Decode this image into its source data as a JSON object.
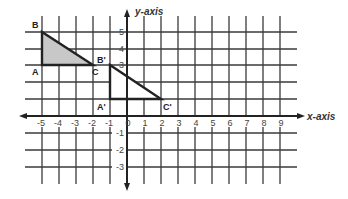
{
  "diagram": {
    "type": "coordinate-plane",
    "x_axis": {
      "label": "x-axis",
      "min": -5,
      "max": 9,
      "tick_labels": [
        "-5",
        "-4",
        "-3",
        "-2",
        "-1",
        "0",
        "1",
        "2",
        "3",
        "4",
        "5",
        "6",
        "7",
        "8",
        "9"
      ]
    },
    "y_axis": {
      "label": "y-axis",
      "min": -3,
      "max": 5,
      "tick_labels": [
        "5",
        "4",
        "3",
        "-1",
        "-2",
        "-3"
      ]
    },
    "shapes": [
      {
        "name": "triangle-ABC",
        "fill": "#c8c8c8",
        "stroke": "#222222",
        "vertices": [
          {
            "label": "A",
            "x": -5,
            "y": 3
          },
          {
            "label": "B",
            "x": -5,
            "y": 5
          },
          {
            "label": "C",
            "x": -2,
            "y": 3
          }
        ]
      },
      {
        "name": "triangle-A'B'C'",
        "fill": "#ffffff",
        "stroke": "#222222",
        "vertices": [
          {
            "label": "A'",
            "x": -1,
            "y": 1
          },
          {
            "label": "B'",
            "x": -1,
            "y": 3
          },
          {
            "label": "C'",
            "x": 2,
            "y": 1
          }
        ]
      }
    ],
    "colors": {
      "grid": "#3a3a3a",
      "axis": "#222222",
      "shaded_fill": "#c8c8c8"
    }
  }
}
